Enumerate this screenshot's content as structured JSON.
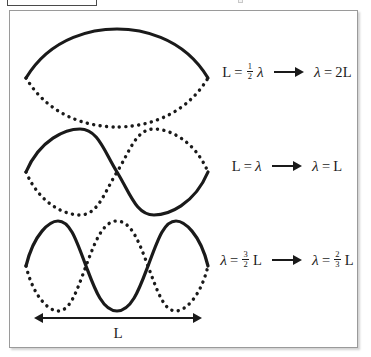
{
  "figure": {
    "border_color": "#9a9a9a",
    "background": "#ffffff",
    "stroke_color": "#1a1a1a",
    "length_arrow": {
      "icon": "double-headed-arrow-icon",
      "label": "L"
    },
    "harmonics": [
      {
        "id": "first-harmonic",
        "antinodes": 1,
        "solid_label": "solid-standing-wave-curve",
        "dotted_label": "dotted-standing-wave-curve",
        "equation": {
          "left": {
            "lhs": "L",
            "eq": "=",
            "fraction": {
              "numerator": "1",
              "denominator": "2"
            },
            "symbol": "λ"
          },
          "arrow": "right-arrow-icon",
          "right": {
            "lhs": "λ",
            "eq": "=",
            "value": "2L"
          }
        }
      },
      {
        "id": "second-harmonic",
        "antinodes": 2,
        "solid_label": "solid-standing-wave-curve",
        "dotted_label": "dotted-standing-wave-curve",
        "equation": {
          "left": {
            "lhs": "L",
            "eq": "=",
            "fraction": null,
            "symbol": "λ"
          },
          "arrow": "right-arrow-icon",
          "right": {
            "lhs": "λ",
            "eq": "=",
            "value": "L"
          }
        }
      },
      {
        "id": "third-harmonic",
        "antinodes": 3,
        "solid_label": "solid-standing-wave-curve",
        "dotted_label": "dotted-standing-wave-curve",
        "equation": {
          "left": {
            "lhs": "λ",
            "eq": "=",
            "fraction": {
              "numerator": "3",
              "denominator": "2"
            },
            "symbol": "L"
          },
          "arrow": "right-arrow-icon",
          "right": {
            "lhs": "λ",
            "eq": "=",
            "fraction": {
              "numerator": "2",
              "denominator": "3"
            },
            "symbol": "L"
          }
        }
      }
    ]
  }
}
